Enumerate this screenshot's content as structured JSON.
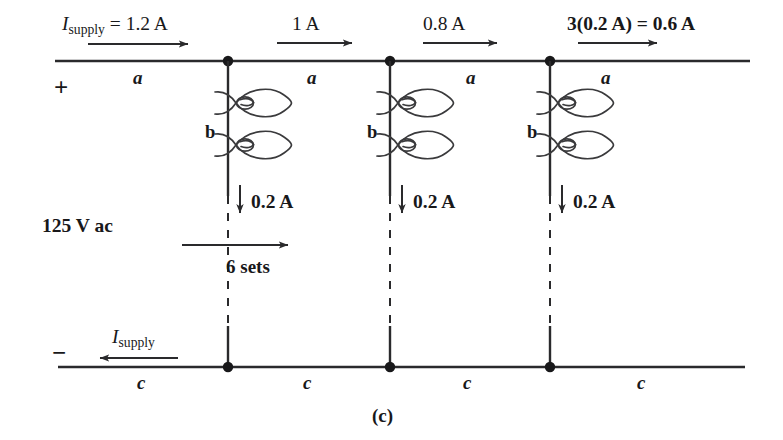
{
  "figure": {
    "caption": "(c)",
    "source_label": "125 V ac",
    "polarity_positive": "+",
    "polarity_negative": "−"
  },
  "top_rail": {
    "segments": [
      {
        "current_label_I": "I",
        "current_label_sub": "supply",
        "current_label_rest": " = 1.2 A",
        "bold": false,
        "conductor": "a"
      },
      {
        "current_label_I": "",
        "current_label_sub": "",
        "current_label_rest": "1 A",
        "bold": false,
        "conductor": "a"
      },
      {
        "current_label_I": "",
        "current_label_sub": "",
        "current_label_rest": "0.8 A",
        "bold": false,
        "conductor": "a"
      },
      {
        "current_label_I": "",
        "current_label_sub": "",
        "current_label_rest": "3(0.2 A) = 0.6 A",
        "bold": true,
        "conductor": "a"
      }
    ]
  },
  "bottom_rail": {
    "return_current_I": "I",
    "return_current_sub": "supply",
    "conductors": [
      "c",
      "c",
      "c",
      "c"
    ]
  },
  "branches": [
    {
      "neutral_label": "b",
      "branch_current": "0.2 A",
      "lamp_count": 2
    },
    {
      "neutral_label": "b",
      "branch_current": "0.2 A",
      "lamp_count": 2
    },
    {
      "neutral_label": "b",
      "branch_current": "0.2 A",
      "lamp_count": 2
    }
  ],
  "span_annotation": {
    "label": "6 sets"
  },
  "colors": {
    "ink": "#18181a",
    "wire": "#2a2a2c",
    "background": "#ffffff"
  }
}
